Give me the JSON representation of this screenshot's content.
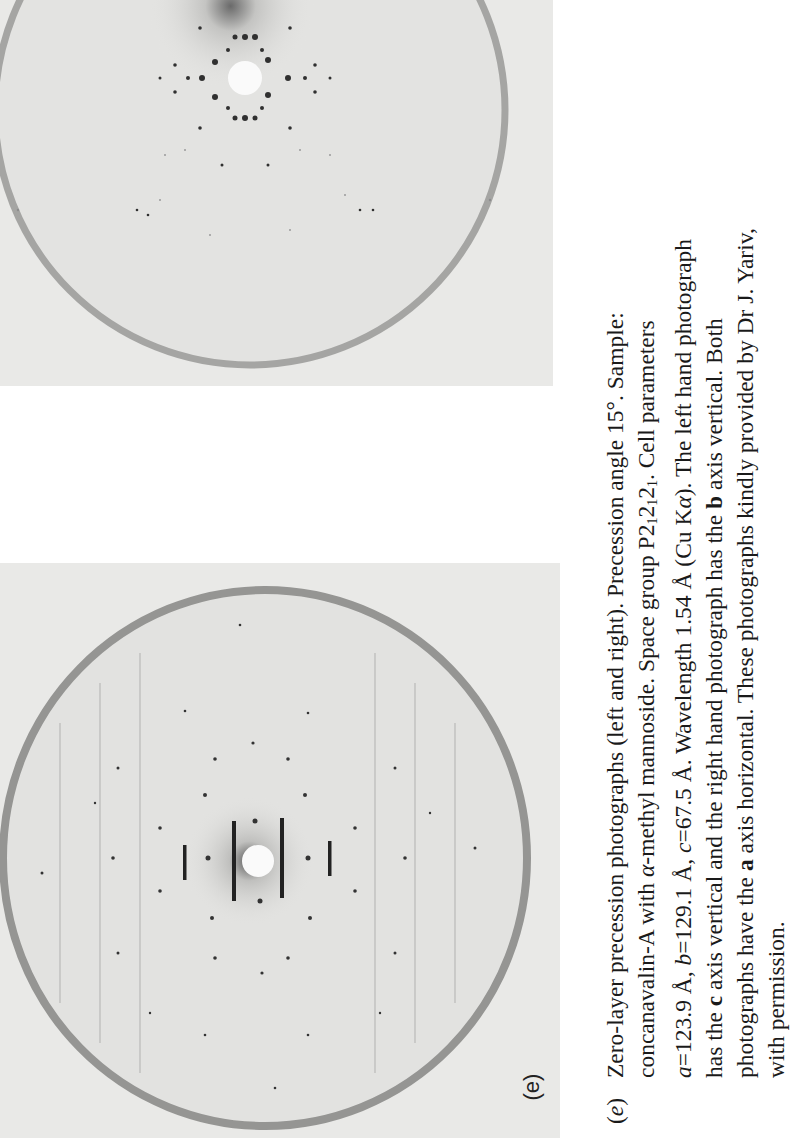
{
  "figure": {
    "panel_label": "(e)",
    "photographs": [
      {
        "position": "top",
        "description": "right hand precession photograph (b axis vertical, a axis horizontal)"
      },
      {
        "position": "bottom",
        "description": "left hand precession photograph (c axis vertical, a axis horizontal)"
      }
    ]
  },
  "caption": {
    "tag_open": "(",
    "tag_letter": "e",
    "tag_close": ")",
    "line1": "Zero-layer precession photographs (left and right). Precession angle 15°. Sample:",
    "line2_a": "concanavalin-A with ",
    "line2_alpha": "α",
    "line2_b": "-methyl mannoside. Space group P2",
    "line2_sub1": "1",
    "line2_c": "2",
    "line2_sub2": "1",
    "line2_d": "2",
    "line2_sub3": "1",
    "line2_e": ". Cell parameters",
    "line3_a_sym": "a",
    "line3_a_val": "=123.9 Å, ",
    "line3_b_sym": "b",
    "line3_b_val": "=129.1 Å, ",
    "line3_c_sym": "c",
    "line3_c_val": "=67.5 Å. Wavelength 1.54 Å (Cu K",
    "line3_alpha": "α",
    "line3_end": "). The left hand photograph",
    "line4_a": "has the ",
    "line4_c": "c",
    "line4_b": " axis vertical and the right hand photograph has the ",
    "line4_bold_b": "b",
    "line4_end": " axis vertical. Both",
    "line5_a": "photographs have the ",
    "line5_bold_a": "a",
    "line5_end": " axis horizontal. These photographs kindly provided by Dr J. Yariv,",
    "line6": "with permission."
  }
}
